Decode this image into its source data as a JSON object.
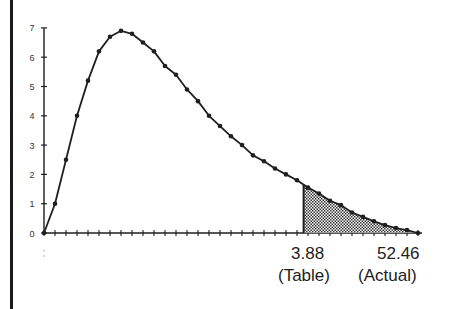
{
  "chart_data": {
    "type": "line",
    "title": "",
    "xlabel": "",
    "ylabel": "",
    "ylim": [
      0,
      7
    ],
    "yticks": [
      "0",
      "1",
      "2",
      "3",
      "4",
      "5",
      "6",
      "7"
    ],
    "grid": false,
    "legend": null,
    "series": [
      {
        "name": "distribution",
        "x": [
          0,
          1,
          2,
          3,
          4,
          5,
          6,
          7,
          8,
          9,
          10,
          11,
          12,
          13,
          14,
          15,
          16,
          17,
          18,
          19,
          20,
          21,
          22,
          23,
          24,
          25,
          26,
          27,
          28,
          29,
          30,
          31,
          32,
          33,
          34
        ],
        "values": [
          0,
          1.0,
          2.5,
          4.0,
          5.2,
          6.2,
          6.7,
          6.9,
          6.8,
          6.5,
          6.2,
          5.7,
          5.4,
          4.9,
          4.5,
          4.0,
          3.65,
          3.3,
          3.0,
          2.65,
          2.45,
          2.2,
          2.0,
          1.8,
          1.55,
          1.35,
          1.1,
          0.95,
          0.7,
          0.55,
          0.4,
          0.27,
          0.17,
          0.1,
          0
        ]
      }
    ],
    "shaded_region": {
      "from_x": 23.6,
      "to_x": 34,
      "pattern": "stipple"
    },
    "annotations": [
      {
        "value": "3.88",
        "caption": "(Table)"
      },
      {
        "value": "52.46",
        "caption": "(Actual)"
      }
    ]
  },
  "labels": {
    "table_value": "3.88",
    "table_caption": "(Table)",
    "actual_value": "52.46",
    "actual_caption": "(Actual)"
  },
  "colors": {
    "ink": "#1f1f1f",
    "fill": "#555555",
    "background": "#ffffff"
  }
}
